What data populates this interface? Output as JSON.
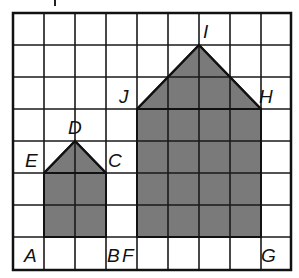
{
  "diagram": {
    "grid": {
      "columns": 9,
      "rows": 8,
      "line_color": "#1a1a1a",
      "background": "#ffffff"
    },
    "fill_color": "#7a7a7a",
    "shapes": [
      {
        "name": "small-pentagon",
        "vertices": [
          "A",
          "B",
          "C",
          "D",
          "E"
        ],
        "grid_coords": {
          "A": [
            1,
            0
          ],
          "B": [
            3,
            0
          ],
          "C": [
            3,
            2
          ],
          "D": [
            2,
            3
          ],
          "E": [
            1,
            2
          ]
        }
      },
      {
        "name": "large-pentagon",
        "vertices": [
          "F",
          "G",
          "H",
          "I",
          "J"
        ],
        "grid_coords": {
          "F": [
            4,
            0
          ],
          "G": [
            8,
            0
          ],
          "H": [
            8,
            4
          ],
          "I": [
            6,
            6
          ],
          "J": [
            4,
            4
          ]
        }
      }
    ],
    "labels": {
      "A": "A",
      "B": "B",
      "C": "C",
      "D": "D",
      "E": "E",
      "F": "F",
      "G": "G",
      "H": "H",
      "I": "I",
      "J": "J"
    }
  }
}
